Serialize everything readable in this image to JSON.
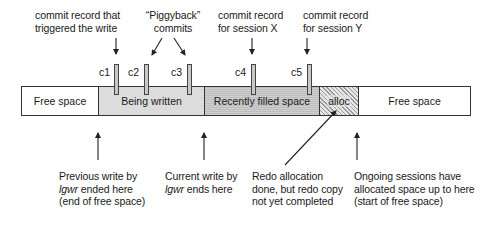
{
  "diagram": {
    "top_labels": {
      "trigger_commit": [
        "commit record that",
        "triggered the write"
      ],
      "piggyback": [
        "“Piggyback”",
        "commits"
      ],
      "session_x": [
        "commit record",
        "for session X"
      ],
      "session_y": [
        "commit record",
        "for session Y"
      ]
    },
    "markers": [
      {
        "id": "c1",
        "label": "c1"
      },
      {
        "id": "c2",
        "label": "c2"
      },
      {
        "id": "c3",
        "label": "c3"
      },
      {
        "id": "c4",
        "label": "c4"
      },
      {
        "id": "c5",
        "label": "c5"
      }
    ],
    "segments": [
      {
        "id": "free-left",
        "label": "Free space"
      },
      {
        "id": "being-written",
        "label": "Being written"
      },
      {
        "id": "recently-filled",
        "label": "Recently filled space"
      },
      {
        "id": "alloc",
        "label": "alloc"
      },
      {
        "id": "free-right",
        "label": "Free space"
      }
    ],
    "bottom_labels": {
      "previous_write": {
        "line1": "Previous write by",
        "line2_italic": "lgwr",
        "line2_rest": " ended here",
        "line3": "(end of free space)"
      },
      "current_write": {
        "line1": "Current write by",
        "line2_italic": "lgwr",
        "line2_rest": " ends here"
      },
      "redo_allocation": [
        "Redo allocation",
        "done, but redo copy",
        "not yet completed"
      ],
      "ongoing_sessions": [
        "Ongoing sessions have",
        "allocated space up to here",
        "(start of free space)"
      ]
    },
    "colors": {
      "line": "#333333",
      "being_written_fill": "#dcdcdc",
      "recently_filled_fill": "#c6c6c6",
      "alloc_hatch": "#9a9a9a",
      "marker_fill": "#c8c8c8"
    }
  }
}
